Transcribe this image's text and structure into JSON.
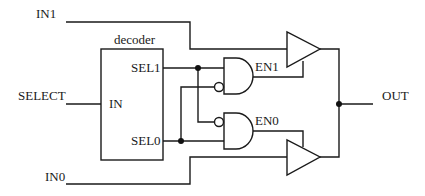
{
  "diagram": {
    "type": "circuit-schematic",
    "title": "",
    "inputs": {
      "in1": "IN1",
      "select": "SELECT",
      "in0": "IN0"
    },
    "outputs": {
      "out": "OUT"
    },
    "decoder": {
      "label": "decoder",
      "port_in": "IN",
      "port_sel1": "SEL1",
      "port_sel0": "SEL0"
    },
    "gates": {
      "and1_output": "EN1",
      "and0_output": "EN0"
    },
    "components": [
      {
        "id": "decoder",
        "kind": "block",
        "label": "decoder"
      },
      {
        "id": "and1",
        "kind": "AND",
        "inputs": [
          "SEL1",
          "NOT SEL0"
        ],
        "output": "EN1"
      },
      {
        "id": "and0",
        "kind": "AND",
        "inputs": [
          "NOT SEL1",
          "SEL0"
        ],
        "output": "EN0"
      },
      {
        "id": "buf1",
        "kind": "tri-state buffer",
        "input": "IN1",
        "enable": "EN1",
        "output": "OUT"
      },
      {
        "id": "buf0",
        "kind": "tri-state buffer",
        "input": "IN0",
        "enable": "EN0",
        "output": "OUT"
      }
    ],
    "colors": {
      "line": "#1a1a1a",
      "background": "#ffffff"
    }
  }
}
